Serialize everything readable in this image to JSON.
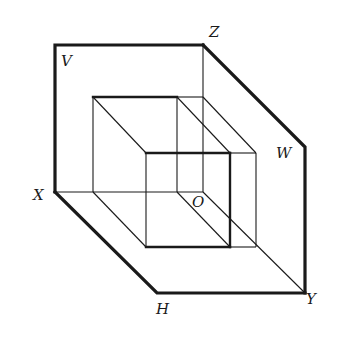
{
  "diagram": {
    "colors": {
      "line": "#1a1a1a",
      "background": "#ffffff"
    },
    "planes": {
      "V": {
        "label": "V"
      },
      "H": {
        "label": "H"
      },
      "W": {
        "label": "W"
      }
    },
    "axes": {
      "X": {
        "label": "X"
      },
      "Y": {
        "label": "Y"
      },
      "Z": {
        "label": "Z"
      },
      "O": {
        "label": "O"
      }
    }
  }
}
